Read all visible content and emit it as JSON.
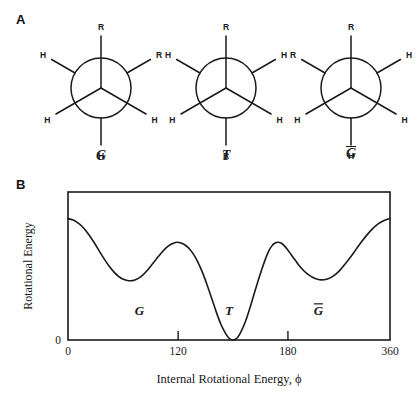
{
  "figure": {
    "panels": [
      {
        "letter": "A",
        "kind": "newman-projections"
      },
      {
        "letter": "B",
        "kind": "energy-plot"
      }
    ]
  },
  "panel_a": {
    "letter": "A",
    "projections": [
      {
        "name": "gauche",
        "label": "G",
        "label_overline": false,
        "front_bonds": [
          {
            "position": "up",
            "atom": "R"
          },
          {
            "position": "lower-left",
            "atom": "H"
          },
          {
            "position": "lower-right",
            "atom": "H"
          }
        ],
        "back_bonds": [
          {
            "position": "upper-left",
            "atom": "H"
          },
          {
            "position": "upper-right",
            "atom": "R"
          },
          {
            "position": "down",
            "atom": "H"
          }
        ]
      },
      {
        "name": "trans",
        "label": "T",
        "label_overline": false,
        "front_bonds": [
          {
            "position": "up",
            "atom": "R"
          },
          {
            "position": "lower-left",
            "atom": "H"
          },
          {
            "position": "lower-right",
            "atom": "H"
          }
        ],
        "back_bonds": [
          {
            "position": "upper-left",
            "atom": "H"
          },
          {
            "position": "upper-right",
            "atom": "H"
          },
          {
            "position": "down",
            "atom": "R"
          }
        ]
      },
      {
        "name": "gauche-bar",
        "label": "G",
        "label_overline": true,
        "front_bonds": [
          {
            "position": "up",
            "atom": "R"
          },
          {
            "position": "lower-left",
            "atom": "H"
          },
          {
            "position": "lower-right",
            "atom": "H"
          }
        ],
        "back_bonds": [
          {
            "position": "upper-left",
            "atom": "R"
          },
          {
            "position": "upper-right",
            "atom": "H"
          },
          {
            "position": "down",
            "atom": "H"
          }
        ]
      }
    ]
  },
  "panel_b": {
    "letter": "B"
  },
  "chart_data": {
    "type": "line",
    "title": "",
    "xlabel": "Internal Rotational Energy, ϕ",
    "ylabel": "Rotational Energy",
    "grid": false,
    "legend": null,
    "xlim": [
      0,
      360
    ],
    "ylim": [
      0,
      1.0
    ],
    "x_tick_labels": [
      "0",
      "120",
      "180",
      "360"
    ],
    "x_tick_values": [
      0,
      120,
      180,
      360
    ],
    "x_tick_positions_fraction": [
      0.0,
      0.342,
      0.683,
      1.0
    ],
    "y_tick_labels": [
      "0"
    ],
    "y_tick_values": [
      0
    ],
    "annotations": [
      {
        "text": "G",
        "overline": false,
        "x": 80,
        "y": 0.17
      },
      {
        "text": "T",
        "overline": false,
        "x": 180,
        "y": 0.17
      },
      {
        "text": "G",
        "overline": true,
        "x": 280,
        "y": 0.17
      }
    ],
    "series": [
      {
        "name": "rotational potential energy",
        "comment": "Relative energy vs torsion angle; minima at G, T (global, = 0), and G-bar.",
        "points": [
          [
            0.0,
            0.82
          ],
          [
            0.02,
            0.812
          ],
          [
            0.04,
            0.795
          ],
          [
            0.06,
            0.77
          ],
          [
            0.08,
            0.735
          ],
          [
            0.1,
            0.693
          ],
          [
            0.12,
            0.645
          ],
          [
            0.14,
            0.594
          ],
          [
            0.16,
            0.545
          ],
          [
            0.18,
            0.5
          ],
          [
            0.2,
            0.462
          ],
          [
            0.22,
            0.432
          ],
          [
            0.24,
            0.412
          ],
          [
            0.26,
            0.402
          ],
          [
            0.275,
            0.4
          ],
          [
            0.29,
            0.404
          ],
          [
            0.31,
            0.418
          ],
          [
            0.33,
            0.442
          ],
          [
            0.35,
            0.475
          ],
          [
            0.37,
            0.513
          ],
          [
            0.39,
            0.552
          ],
          [
            0.41,
            0.59
          ],
          [
            0.43,
            0.622
          ],
          [
            0.45,
            0.645
          ],
          [
            0.465,
            0.656
          ],
          [
            0.478,
            0.66
          ],
          [
            0.492,
            0.657
          ],
          [
            0.51,
            0.645
          ],
          [
            0.53,
            0.62
          ],
          [
            0.55,
            0.58
          ],
          [
            0.57,
            0.525
          ],
          [
            0.59,
            0.455
          ],
          [
            0.61,
            0.372
          ],
          [
            0.63,
            0.282
          ],
          [
            0.65,
            0.19
          ],
          [
            0.67,
            0.108
          ],
          [
            0.69,
            0.046
          ],
          [
            0.705,
            0.014
          ],
          [
            0.718,
            0.001
          ],
          [
            0.73,
            0.002
          ],
          [
            0.745,
            0.02
          ],
          [
            0.76,
            0.06
          ],
          [
            0.778,
            0.125
          ],
          [
            0.796,
            0.208
          ],
          [
            0.814,
            0.3
          ],
          [
            0.832,
            0.392
          ],
          [
            0.85,
            0.478
          ],
          [
            0.866,
            0.548
          ],
          [
            0.88,
            0.6
          ],
          [
            0.894,
            0.636
          ],
          [
            0.908,
            0.655
          ],
          [
            0.92,
            0.66
          ],
          [
            0.934,
            0.655
          ],
          [
            0.948,
            0.638
          ],
          [
            0.962,
            0.612
          ],
          [
            0.978,
            0.578
          ],
          [
            0.996,
            0.54
          ],
          [
            1.014,
            0.502
          ],
          [
            1.034,
            0.468
          ],
          [
            1.054,
            0.441
          ],
          [
            1.074,
            0.422
          ],
          [
            1.094,
            0.41
          ],
          [
            1.112,
            0.406
          ],
          [
            1.13,
            0.409
          ],
          [
            1.15,
            0.42
          ],
          [
            1.172,
            0.442
          ],
          [
            1.194,
            0.474
          ],
          [
            1.216,
            0.515
          ],
          [
            1.24,
            0.563
          ],
          [
            1.264,
            0.614
          ],
          [
            1.288,
            0.665
          ],
          [
            1.312,
            0.712
          ],
          [
            1.336,
            0.753
          ],
          [
            1.36,
            0.785
          ],
          [
            1.384,
            0.806
          ],
          [
            1.4,
            0.816
          ],
          [
            1.412,
            0.82
          ]
        ],
        "note": "x in fractional plot width (0..1 maps left..right frame); y fraction of plot height above baseline"
      }
    ]
  }
}
